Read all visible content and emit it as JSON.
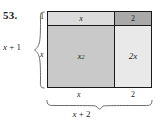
{
  "figure": {
    "exercise_number": "53.",
    "type": "algebra-tile-area-model",
    "left_total_label": "x + 1",
    "left_total_var": "x",
    "left_total_op": " + ",
    "left_total_const": "1",
    "bottom_total_label": "x + 2",
    "bottom_total_var": "x",
    "bottom_total_op": " + ",
    "bottom_total_const": "2",
    "left_segments": [
      {
        "label": "1",
        "name": "height-segment-1"
      },
      {
        "label": "x",
        "name": "height-segment-x"
      }
    ],
    "bottom_segments": [
      {
        "label": "x",
        "name": "width-segment-x"
      },
      {
        "label": "2",
        "name": "width-segment-2"
      }
    ],
    "cells": [
      {
        "id": "cell-x",
        "label": "x",
        "superscript": "",
        "fill": "#dcdcdc"
      },
      {
        "id": "cell-2",
        "label": "2",
        "superscript": "",
        "fill": "#a9a9a9"
      },
      {
        "id": "cell-x2",
        "label": "x",
        "superscript": "2",
        "fill": "#c9c9c9"
      },
      {
        "id": "cell-2x",
        "label": "2x",
        "superscript": "",
        "fill": "#e9e9e9"
      }
    ],
    "colors": {
      "outline": "#1a1a1a",
      "text": "#231f20",
      "background": "#ffffff"
    }
  }
}
